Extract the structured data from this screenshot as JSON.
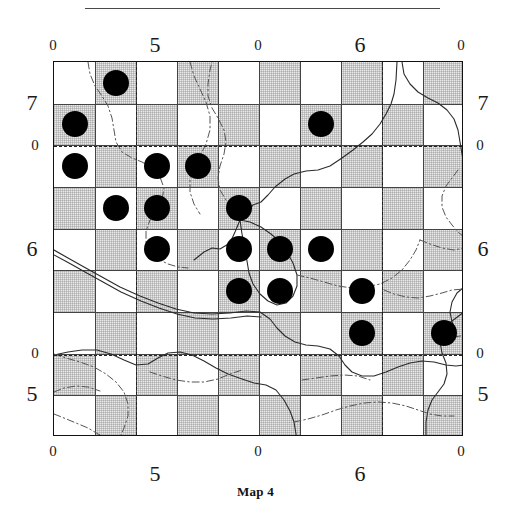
{
  "figure": {
    "caption": "Map 4",
    "type": "dot-distribution-grid-map"
  },
  "axes": {
    "top": [
      {
        "label": "0",
        "size": "small",
        "x": 53
      },
      {
        "label": "5",
        "size": "big",
        "x": 155
      },
      {
        "label": "0",
        "size": "small",
        "x": 258
      },
      {
        "label": "6",
        "size": "big",
        "x": 360
      },
      {
        "label": "0",
        "size": "small",
        "x": 461
      }
    ],
    "bottom": [
      {
        "label": "0",
        "size": "small",
        "x": 53
      },
      {
        "label": "5",
        "size": "big",
        "x": 155
      },
      {
        "label": "0",
        "size": "small",
        "x": 258
      },
      {
        "label": "6",
        "size": "big",
        "x": 360
      },
      {
        "label": "0",
        "size": "small",
        "x": 461
      }
    ],
    "left": [
      {
        "label": "7",
        "size": "big",
        "y": 103
      },
      {
        "label": "0",
        "size": "small",
        "y": 145
      },
      {
        "label": "6",
        "size": "big",
        "y": 249
      },
      {
        "label": "0",
        "size": "small",
        "y": 353
      },
      {
        "label": "5",
        "size": "big",
        "y": 394
      }
    ],
    "right": [
      {
        "label": "7",
        "size": "big",
        "y": 103
      },
      {
        "label": "0",
        "size": "small",
        "y": 145
      },
      {
        "label": "6",
        "size": "big",
        "y": 249
      },
      {
        "label": "0",
        "size": "small",
        "y": 353
      },
      {
        "label": "5",
        "size": "big",
        "y": 394
      }
    ]
  },
  "chart_data": {
    "type": "scatter",
    "title": "Map 4",
    "xlabel": "",
    "ylabel": "",
    "grid": true,
    "legend": false,
    "grid_cols": 10,
    "grid_rows": 9,
    "cell_width": 41.0,
    "cell_height": 41.666,
    "xtick_labels": [
      "0",
      "5",
      "0",
      "6",
      "0"
    ],
    "ytick_labels": [
      "7",
      "0",
      "6",
      "0",
      "5"
    ],
    "dot_color": "#000000",
    "shade_color": "#e9e9e9",
    "points": [
      {
        "col": 2,
        "row": 1
      },
      {
        "col": 1,
        "row": 2
      },
      {
        "col": 7,
        "row": 2
      },
      {
        "col": 1,
        "row": 3
      },
      {
        "col": 3,
        "row": 3
      },
      {
        "col": 4,
        "row": 3
      },
      {
        "col": 2,
        "row": 4
      },
      {
        "col": 3,
        "row": 4
      },
      {
        "col": 5,
        "row": 4
      },
      {
        "col": 3,
        "row": 5
      },
      {
        "col": 5,
        "row": 5
      },
      {
        "col": 6,
        "row": 5
      },
      {
        "col": 7,
        "row": 5
      },
      {
        "col": 5,
        "row": 6
      },
      {
        "col": 6,
        "row": 6
      },
      {
        "col": 8,
        "row": 6
      },
      {
        "col": 8,
        "row": 7
      },
      {
        "col": 10,
        "row": 7
      }
    ],
    "point_count": 18,
    "shaded_cells": [
      [
        1,
        2
      ],
      [
        3,
        2
      ],
      [
        5,
        2
      ],
      [
        7,
        2
      ],
      [
        9,
        2
      ],
      [
        2,
        1
      ],
      [
        4,
        1
      ],
      [
        6,
        1
      ],
      [
        8,
        1
      ],
      [
        10,
        1
      ],
      [
        2,
        3
      ],
      [
        4,
        3
      ],
      [
        6,
        3
      ],
      [
        8,
        3
      ],
      [
        10,
        3
      ],
      [
        1,
        4
      ],
      [
        3,
        4
      ],
      [
        5,
        4
      ],
      [
        7,
        4
      ],
      [
        9,
        4
      ],
      [
        2,
        5
      ],
      [
        4,
        5
      ],
      [
        6,
        5
      ],
      [
        8,
        5
      ],
      [
        10,
        5
      ],
      [
        1,
        6
      ],
      [
        3,
        6
      ],
      [
        5,
        6
      ],
      [
        7,
        6
      ],
      [
        9,
        6
      ],
      [
        2,
        7
      ],
      [
        4,
        7
      ],
      [
        6,
        7
      ],
      [
        8,
        7
      ],
      [
        10,
        7
      ],
      [
        1,
        8
      ],
      [
        3,
        8
      ],
      [
        5,
        8
      ],
      [
        7,
        8
      ],
      [
        9,
        8
      ],
      [
        2,
        9
      ],
      [
        4,
        9
      ],
      [
        6,
        9
      ],
      [
        8,
        9
      ],
      [
        10,
        9
      ]
    ],
    "reference_lines": {
      "vertical": [
        135,
        381
      ],
      "horizontal": [
        145,
        354
      ]
    }
  }
}
